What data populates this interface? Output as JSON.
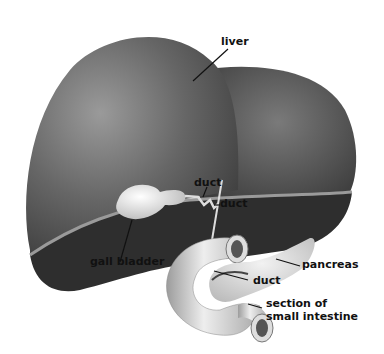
{
  "diagram": {
    "labels": {
      "liver": "liver",
      "duct_upper": "duct",
      "duct_lower": "duct",
      "gall_bladder": "gall bladder",
      "pancreas": "pancreas",
      "duct_pancreas": "duct",
      "small_intestine_line1": "section of",
      "small_intestine_line2": "small intestine"
    },
    "colors": {
      "liver": "#5a5a5a",
      "liver_highlight": "#8a8a8a",
      "liver_underside": "#2e2e2e",
      "gall_bladder": "#e8e8e8",
      "pancreas": "#d8d8d8",
      "intestine": "#cfcfcf",
      "label": "#111111"
    }
  }
}
